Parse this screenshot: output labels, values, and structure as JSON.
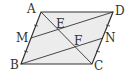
{
  "diagram": {
    "type": "geometry",
    "shape": "parallelogram ABCD",
    "fill_color": "#ececec",
    "stroke_color": "#333333",
    "points": {
      "A": {
        "label": "A",
        "x": 41,
        "y": 12
      },
      "D": {
        "label": "D",
        "x": 113,
        "y": 12
      },
      "B": {
        "label": "B",
        "x": 21,
        "y": 64
      },
      "C": {
        "label": "C",
        "x": 92,
        "y": 64
      },
      "M": {
        "label": "M",
        "x": 31,
        "y": 38
      },
      "N": {
        "label": "N",
        "x": 103,
        "y": 38
      },
      "E": {
        "label": "E"
      },
      "F": {
        "label": "F"
      }
    },
    "segments": [
      "AB",
      "BC",
      "CD",
      "DA",
      "AC",
      "MD",
      "BN"
    ],
    "tick_marks": [
      "AM",
      "MB",
      "DN",
      "NC"
    ]
  }
}
